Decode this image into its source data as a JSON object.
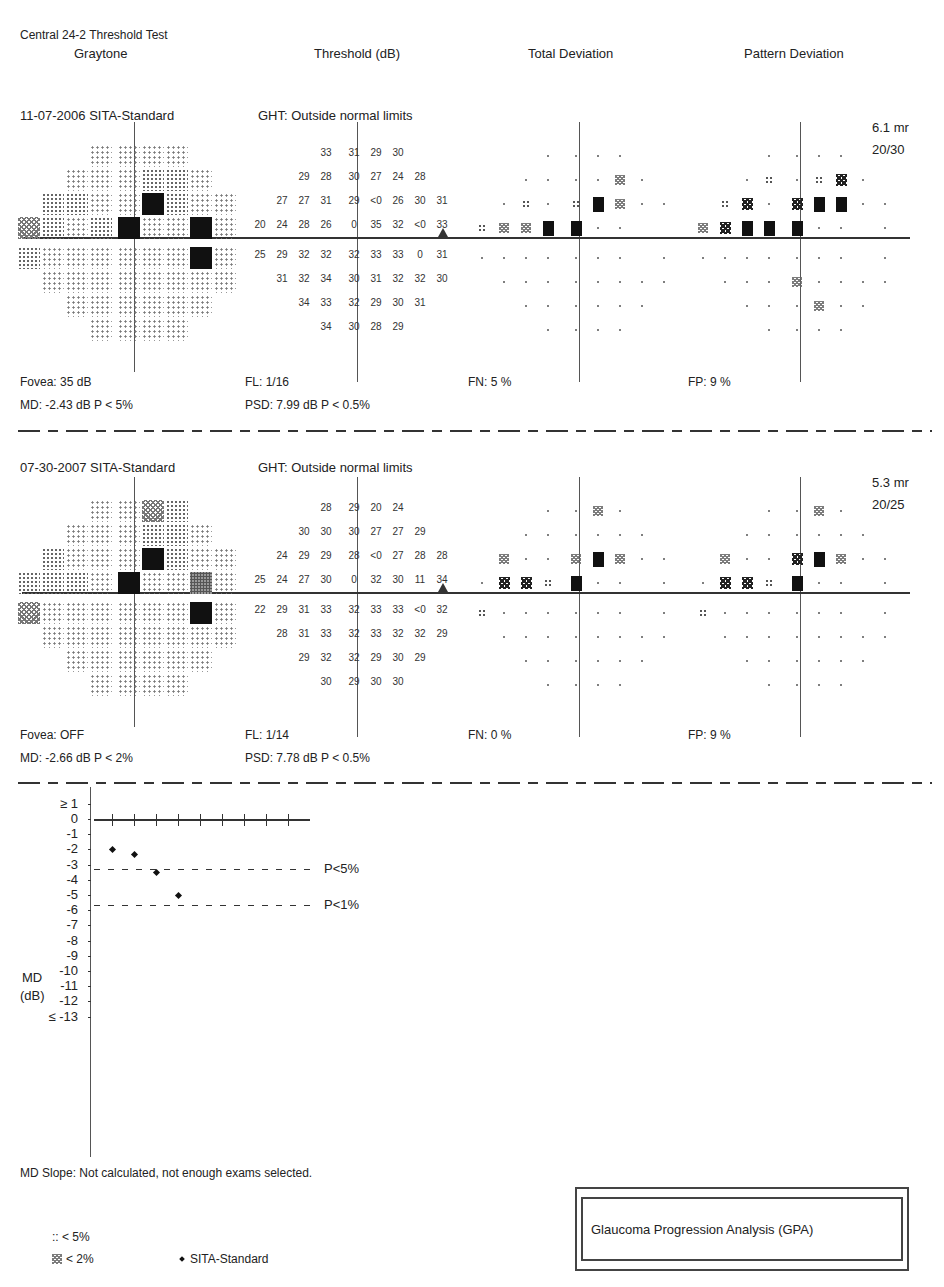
{
  "report": {
    "test_name": "Central 24-2 Threshold Test",
    "columns": [
      "Graytone",
      "Threshold (dB)",
      "Total Deviation",
      "Pattern Deviation"
    ]
  },
  "exams": [
    {
      "date_strategy": "11-07-2006 SITA-Standard",
      "ght": "GHT: Outside normal limits",
      "pupil": "6.1 mr",
      "acuity": "20/30",
      "fovea": "Fovea: 35 dB",
      "fl": "FL: 1/16",
      "fn": "FN:  5 %",
      "fp": "FP:  9 %",
      "md": "MD:  -2.43 dB  P < 5%",
      "psd": "PSD:  7.99 dB  P < 0.5%",
      "threshold_rows": [
        [
          "33",
          "31",
          "29",
          "30"
        ],
        [
          "29",
          "28",
          "30",
          "27",
          "24",
          "28"
        ],
        [
          "27",
          "27",
          "31",
          "29",
          "<0",
          "26",
          "30",
          "31"
        ],
        [
          "20",
          "24",
          "28",
          "26",
          "0",
          "35",
          "32",
          "<0",
          "33"
        ],
        [
          "25",
          "29",
          "32",
          "32",
          "32",
          "33",
          "33",
          "0",
          "31"
        ],
        [
          "31",
          "32",
          "34",
          "30",
          "31",
          "32",
          "32",
          "30"
        ],
        [
          "34",
          "33",
          "32",
          "29",
          "30",
          "31"
        ],
        [
          "34",
          "30",
          "28",
          "29"
        ]
      ],
      "total_deviation_rows": [
        [
          ".",
          ".",
          ".",
          "."
        ],
        [
          ".",
          ".",
          ".",
          ".",
          "z",
          "."
        ],
        [
          ".",
          ":",
          ".",
          ":",
          "B",
          "z",
          ".",
          "."
        ],
        [
          ":",
          "z",
          "z",
          "B",
          "B",
          ".",
          ".",
          "",
          ""
        ],
        [
          ".",
          ".",
          ".",
          ".",
          ".",
          ".",
          ".",
          "",
          "."
        ],
        [
          ".",
          ".",
          ".",
          ".",
          ".",
          ".",
          ".",
          "."
        ],
        [
          ".",
          ".",
          ".",
          ".",
          ".",
          "."
        ],
        [
          ".",
          ".",
          ".",
          "."
        ]
      ],
      "pattern_deviation_rows": [
        [
          ".",
          ".",
          ".",
          "."
        ],
        [
          ".",
          ":",
          ".",
          ":",
          "x",
          "."
        ],
        [
          ":",
          "x",
          ".",
          "x",
          "B",
          "B",
          ".",
          "."
        ],
        [
          "z",
          "x",
          "B",
          "B",
          "B",
          ".",
          ".",
          "",
          "."
        ],
        [
          ".",
          ".",
          ".",
          ".",
          ".",
          ".",
          ".",
          "",
          "."
        ],
        [
          ".",
          ".",
          ".",
          "z",
          ".",
          ".",
          ".",
          "."
        ],
        [
          ".",
          ".",
          ".",
          "z",
          ".",
          "."
        ],
        [
          ".",
          ".",
          ".",
          "."
        ]
      ]
    },
    {
      "date_strategy": "07-30-2007 SITA-Standard",
      "ght": "GHT: Outside normal limits",
      "pupil": "5.3 mr",
      "acuity": "20/25",
      "fovea": "Fovea: OFF",
      "fl": "FL: 1/14",
      "fn": "FN:  0 %",
      "fp": "FP:  9 %",
      "md": "MD:  -2.66 dB  P < 2%",
      "psd": "PSD:  7.78 dB  P < 0.5%",
      "threshold_rows": [
        [
          "28",
          "29",
          "20",
          "24"
        ],
        [
          "30",
          "30",
          "30",
          "27",
          "27",
          "29"
        ],
        [
          "24",
          "29",
          "29",
          "28",
          "<0",
          "27",
          "28",
          "28"
        ],
        [
          "25",
          "24",
          "27",
          "30",
          "0",
          "32",
          "30",
          "11",
          "34"
        ],
        [
          "22",
          "29",
          "31",
          "33",
          "32",
          "33",
          "33",
          "<0",
          "32"
        ],
        [
          "28",
          "31",
          "33",
          "32",
          "33",
          "32",
          "32",
          "29"
        ],
        [
          "29",
          "32",
          "32",
          "29",
          "30",
          "29"
        ],
        [
          "30",
          "29",
          "30",
          "30"
        ]
      ],
      "total_deviation_rows": [
        [
          ".",
          ".",
          "z",
          "."
        ],
        [
          ".",
          ".",
          ".",
          ".",
          ".",
          "."
        ],
        [
          "z",
          ".",
          ".",
          "z",
          "B",
          "z",
          ".",
          "."
        ],
        [
          ".",
          "x",
          "x",
          ":",
          "B",
          ".",
          ".",
          "",
          "."
        ],
        [
          ":",
          ".",
          ".",
          ".",
          ".",
          ".",
          ".",
          "",
          "."
        ],
        [
          ".",
          ".",
          ".",
          ".",
          ".",
          ".",
          ".",
          "."
        ],
        [
          ".",
          ".",
          ".",
          ".",
          ".",
          "."
        ],
        [
          ".",
          ".",
          ".",
          "."
        ]
      ],
      "pattern_deviation_rows": [
        [
          ".",
          ".",
          "z",
          "."
        ],
        [
          ".",
          ".",
          ".",
          ".",
          ".",
          "."
        ],
        [
          "z",
          ".",
          ".",
          "x",
          "B",
          "z",
          ".",
          "."
        ],
        [
          ".",
          "x",
          "x",
          ":",
          "B",
          ".",
          ".",
          "",
          "."
        ],
        [
          ":",
          ".",
          ".",
          ".",
          ".",
          ".",
          ".",
          "",
          "."
        ],
        [
          ".",
          ".",
          ".",
          ".",
          ".",
          ".",
          ".",
          "."
        ],
        [
          ".",
          ".",
          ".",
          ".",
          ".",
          "."
        ],
        [
          ".",
          ".",
          ".",
          "."
        ]
      ]
    }
  ],
  "md_chart": {
    "ylabel_line1": "MD",
    "ylabel_line2": "(dB)",
    "ticks": [
      "≥ 1",
      "0",
      "-1",
      "-2",
      "-3",
      "-4",
      "-5",
      "-6",
      "-7",
      "-8",
      "-9",
      "-10",
      "-11",
      "-12",
      "≤ -13"
    ],
    "p5_label": "P<5%",
    "p1_label": "P<1%"
  },
  "chart_data": {
    "type": "scatter",
    "xlabel": "",
    "ylabel": "MD (dB)",
    "ylim": [
      -13,
      1
    ],
    "y_ticks": [
      1,
      0,
      -1,
      -2,
      -3,
      -4,
      -5,
      -6,
      -7,
      -8,
      -9,
      -10,
      -11,
      -12,
      -13
    ],
    "x_ticks_count": 9,
    "series": [
      {
        "name": "SITA-Standard",
        "x": [
          1,
          2,
          3,
          4
        ],
        "y": [
          -2.0,
          -2.3,
          -3.5,
          -5.0
        ]
      }
    ],
    "reference_lines": [
      {
        "label": "P<5%",
        "y": -2.0
      },
      {
        "label": "P<1%",
        "y": -3.5
      }
    ],
    "grid": false
  },
  "footer": {
    "md_slope": "MD Slope: Not calculated, not enough exams selected.",
    "legend_p5": ":: < 5%",
    "legend_p2": "< 2%",
    "legend_sita": "SITA-Standard",
    "gpa_title": "Glaucoma Progression Analysis (GPA)"
  }
}
